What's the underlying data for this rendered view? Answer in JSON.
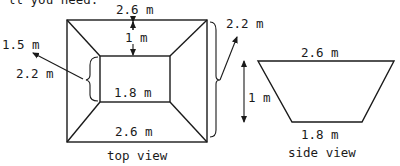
{
  "header": {
    "cut_off_text": "ll you need."
  },
  "top_view": {
    "caption": "top view",
    "outer_top_label": "2.6 m",
    "outer_bottom_label": "2.6 m",
    "depth_label": "1 m",
    "inner_bottom_label": "1.8 m",
    "slant_label": "1.5 m",
    "inner_side_label": "2.2 m",
    "outer_side_label": "2.2 m"
  },
  "side_view": {
    "caption": "side view",
    "top_label": "2.6 m",
    "bottom_label": "1.8 m",
    "height_label": "1 m"
  },
  "colors": {
    "ink": "#1a1a1a",
    "background": "#ffffff"
  }
}
